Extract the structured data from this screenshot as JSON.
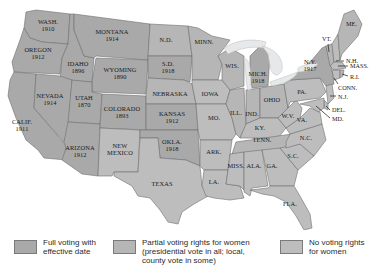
{
  "colors": {
    "full": "#a9a9a9",
    "partial": "#b6b6b6",
    "none": "#bdbdbd",
    "lake": "#e6e8ea",
    "border": "#6f6f6f"
  },
  "map": {
    "states": [
      {
        "id": "WA",
        "label": "WASH.",
        "year": "1910",
        "status": "full"
      },
      {
        "id": "OR",
        "label": "OREGON",
        "year": "1912",
        "status": "full"
      },
      {
        "id": "CA",
        "label": "CALIF.",
        "year": "1911",
        "status": "full"
      },
      {
        "id": "ID",
        "label": "IDAHO",
        "year": "1896",
        "status": "full"
      },
      {
        "id": "NV",
        "label": "NEVADA",
        "year": "1914",
        "status": "full"
      },
      {
        "id": "MT",
        "label": "MONTANA",
        "year": "1914",
        "status": "full"
      },
      {
        "id": "WY",
        "label": "WYOMING",
        "year": "1890",
        "status": "full"
      },
      {
        "id": "UT",
        "label": "UTAH",
        "year": "1870",
        "status": "full"
      },
      {
        "id": "AZ",
        "label": "ARIZONA",
        "year": "1912",
        "status": "full"
      },
      {
        "id": "CO",
        "label": "COLORADO",
        "year": "1893",
        "status": "full"
      },
      {
        "id": "NM",
        "label": "NEW MEXICO",
        "year": "",
        "status": "none"
      },
      {
        "id": "ND",
        "label": "N.D.",
        "year": "",
        "status": "partial"
      },
      {
        "id": "SD",
        "label": "S.D.",
        "year": "1918",
        "status": "full"
      },
      {
        "id": "NE",
        "label": "NEBRASKA",
        "year": "",
        "status": "partial"
      },
      {
        "id": "KS",
        "label": "KANSAS",
        "year": "1912",
        "status": "full"
      },
      {
        "id": "OK",
        "label": "OKLA.",
        "year": "1918",
        "status": "full"
      },
      {
        "id": "TX",
        "label": "TEXAS",
        "year": "",
        "status": "none"
      },
      {
        "id": "MN",
        "label": "MINN.",
        "year": "",
        "status": "partial"
      },
      {
        "id": "IA",
        "label": "IOWA",
        "year": "",
        "status": "none"
      },
      {
        "id": "MO",
        "label": "MO.",
        "year": "",
        "status": "none"
      },
      {
        "id": "AR",
        "label": "ARK.",
        "year": "",
        "status": "none"
      },
      {
        "id": "LA",
        "label": "LA.",
        "year": "",
        "status": "none"
      },
      {
        "id": "WI",
        "label": "WIS.",
        "year": "",
        "status": "partial"
      },
      {
        "id": "IL",
        "label": "ILL.",
        "year": "",
        "status": "partial"
      },
      {
        "id": "MI",
        "label": "MICH.",
        "year": "1918",
        "status": "full"
      },
      {
        "id": "IN",
        "label": "IND.",
        "year": "",
        "status": "partial"
      },
      {
        "id": "OH",
        "label": "OHIO",
        "year": "",
        "status": "partial"
      },
      {
        "id": "KY",
        "label": "KY.",
        "year": "",
        "status": "none"
      },
      {
        "id": "TN",
        "label": "TENN.",
        "year": "",
        "status": "partial"
      },
      {
        "id": "MS",
        "label": "MISS.",
        "year": "",
        "status": "none"
      },
      {
        "id": "AL",
        "label": "ALA.",
        "year": "",
        "status": "none"
      },
      {
        "id": "GA",
        "label": "GA.",
        "year": "",
        "status": "none"
      },
      {
        "id": "FL",
        "label": "FLA.",
        "year": "",
        "status": "none"
      },
      {
        "id": "SC",
        "label": "S.C.",
        "year": "",
        "status": "none"
      },
      {
        "id": "NC",
        "label": "N.C.",
        "year": "",
        "status": "none"
      },
      {
        "id": "VA",
        "label": "VA.",
        "year": "",
        "status": "none"
      },
      {
        "id": "WV",
        "label": "W.V.",
        "year": "",
        "status": "none"
      },
      {
        "id": "PA",
        "label": "PA.",
        "year": "",
        "status": "none"
      },
      {
        "id": "NY",
        "label": "N.Y.",
        "year": "1917",
        "status": "full"
      },
      {
        "id": "ME",
        "label": "ME.",
        "year": "",
        "status": "partial"
      },
      {
        "id": "VT",
        "label": "VT.",
        "year": "",
        "status": "partial"
      },
      {
        "id": "NH",
        "label": "N.H.",
        "year": "",
        "status": "none"
      },
      {
        "id": "MA",
        "label": "MASS.",
        "year": "",
        "status": "none"
      },
      {
        "id": "RI",
        "label": "R.I.",
        "year": "",
        "status": "partial"
      },
      {
        "id": "CT",
        "label": "CONN.",
        "year": "",
        "status": "none"
      },
      {
        "id": "NJ",
        "label": "N.J.",
        "year": "",
        "status": "none"
      },
      {
        "id": "DE",
        "label": "DEL.",
        "year": "",
        "status": "none"
      },
      {
        "id": "MD",
        "label": "MD.",
        "year": "",
        "status": "none"
      }
    ]
  },
  "legend": {
    "items": [
      {
        "key": "full",
        "text": "Full voting with\neffective date"
      },
      {
        "key": "partial",
        "text": "Partial voting rights for women\n(presidential vote in all; local,\ncounty vote in some)"
      },
      {
        "key": "none",
        "text": "No voting rights\nfor women"
      }
    ]
  }
}
